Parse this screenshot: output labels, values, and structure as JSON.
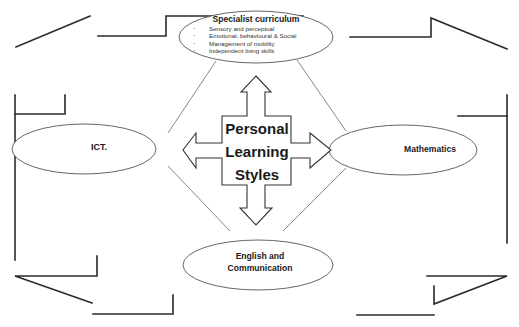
{
  "diagram": {
    "center": {
      "lines": [
        "Personal",
        "Learning",
        "Styles"
      ]
    },
    "nodes": {
      "top": {
        "title": "Specialist curriculum",
        "bullets": [
          "Sensory and perceptual",
          "Emotional, behavioural & Social",
          "Management of mobility",
          "Independent living skills"
        ]
      },
      "left": {
        "title": "ICT."
      },
      "right": {
        "title": "Mathematics"
      },
      "bottom": {
        "title_line1": "English and",
        "title_line2": "Communication"
      }
    },
    "colors": {
      "stroke": "#2a2a2a",
      "connector": "#6a6a6a",
      "background": "#ffffff"
    }
  }
}
